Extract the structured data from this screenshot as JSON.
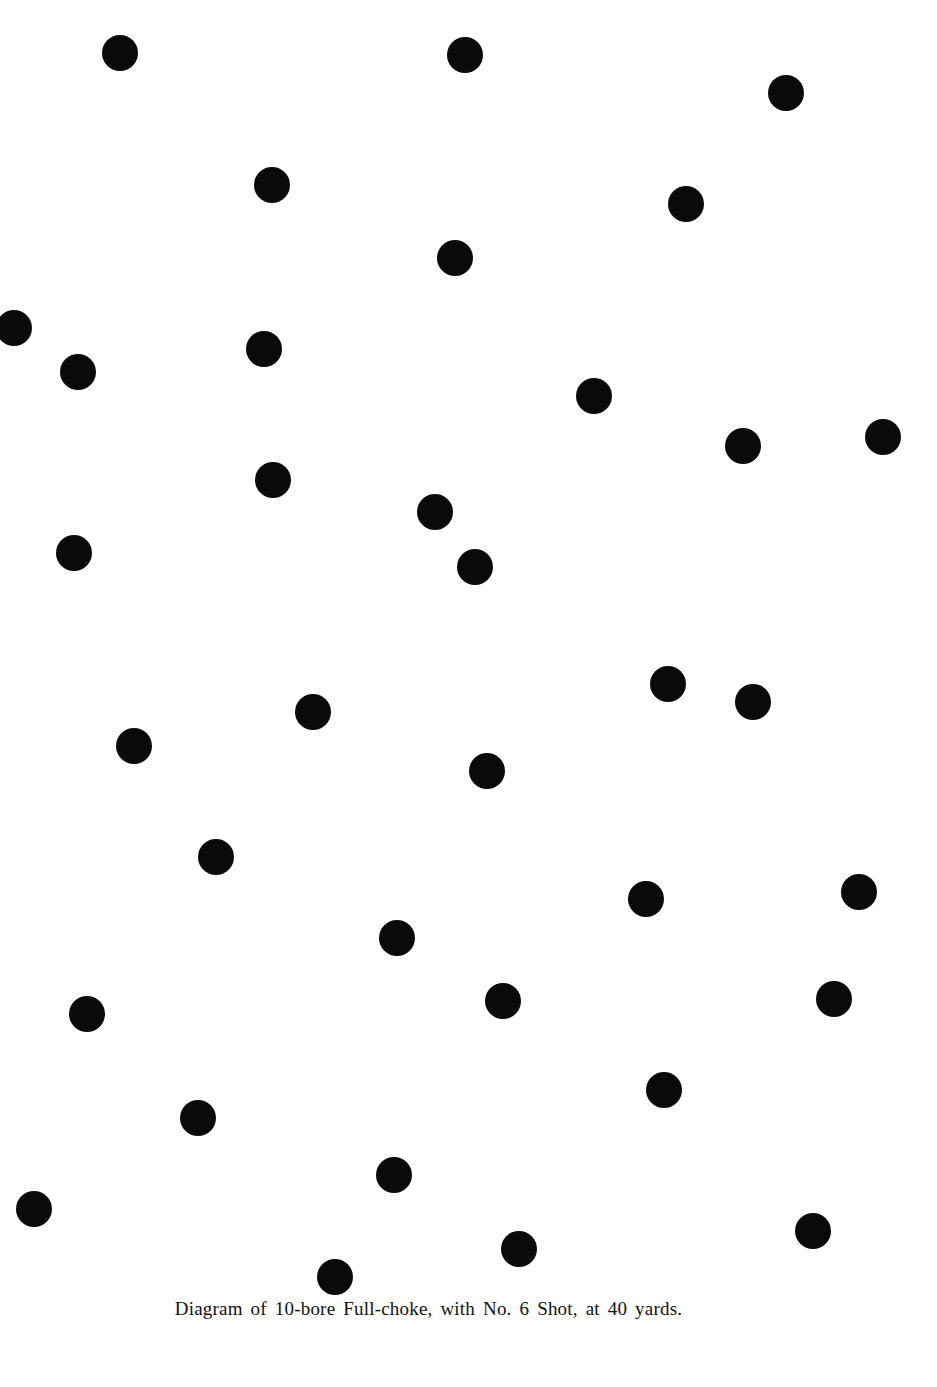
{
  "diagram": {
    "caption": "Diagram of 10-bore Full-choke, with No. 6 Shot, at 40 yards.",
    "pellet_color": "#0a0a0a",
    "background_color": "#ffffff",
    "pellet_count": 38,
    "pellets": [
      {
        "x": 120,
        "y": 53
      },
      {
        "x": 465,
        "y": 55
      },
      {
        "x": 786,
        "y": 93
      },
      {
        "x": 272,
        "y": 185
      },
      {
        "x": 686,
        "y": 204
      },
      {
        "x": 455,
        "y": 258
      },
      {
        "x": 14,
        "y": 328
      },
      {
        "x": 264,
        "y": 349
      },
      {
        "x": 78,
        "y": 372
      },
      {
        "x": 594,
        "y": 396
      },
      {
        "x": 743,
        "y": 446
      },
      {
        "x": 883,
        "y": 437
      },
      {
        "x": 273,
        "y": 480
      },
      {
        "x": 435,
        "y": 512
      },
      {
        "x": 74,
        "y": 553
      },
      {
        "x": 475,
        "y": 567
      },
      {
        "x": 668,
        "y": 684
      },
      {
        "x": 753,
        "y": 702
      },
      {
        "x": 313,
        "y": 712
      },
      {
        "x": 134,
        "y": 746
      },
      {
        "x": 487,
        "y": 771
      },
      {
        "x": 216,
        "y": 857
      },
      {
        "x": 646,
        "y": 899
      },
      {
        "x": 859,
        "y": 892
      },
      {
        "x": 397,
        "y": 938
      },
      {
        "x": 87,
        "y": 1014
      },
      {
        "x": 503,
        "y": 1001
      },
      {
        "x": 834,
        "y": 999
      },
      {
        "x": 664,
        "y": 1090
      },
      {
        "x": 198,
        "y": 1118
      },
      {
        "x": 394,
        "y": 1175
      },
      {
        "x": 34,
        "y": 1209
      },
      {
        "x": 519,
        "y": 1249
      },
      {
        "x": 813,
        "y": 1231
      },
      {
        "x": 335,
        "y": 1277
      }
    ]
  }
}
